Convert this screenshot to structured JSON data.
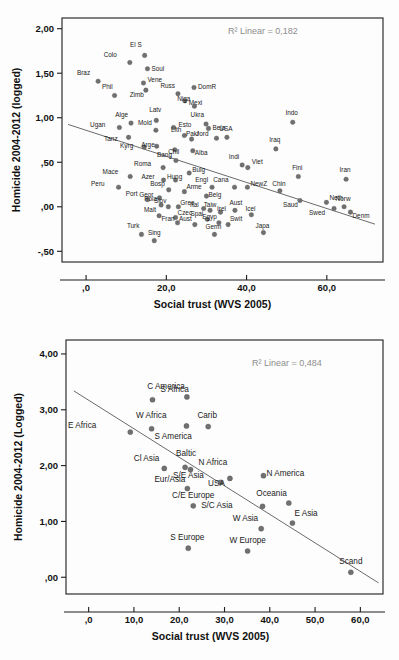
{
  "chart_data": [
    {
      "id": "top",
      "type": "scatter",
      "title": "",
      "xlabel": "Social trust (WVS 2005)",
      "ylabel": "Homicide 2004-2012 (logged)",
      "annotation": "R² Linear = 0,182",
      "xlim": [
        -6.0,
        74.0
      ],
      "ylim": [
        -0.62,
        2.12
      ],
      "xticks": [
        0,
        20,
        40,
        60
      ],
      "xticklabels": [
        ",0",
        "20,0",
        "40,0",
        "60,0"
      ],
      "yticks": [
        -0.5,
        0.0,
        0.5,
        1.0,
        1.5,
        2.0
      ],
      "yticklabels": [
        "-,50",
        ",00",
        ",50",
        "1,00",
        "1,50",
        "2,00"
      ],
      "grid": false,
      "legend": "none",
      "fit": {
        "x0": -4.5,
        "y0": 0.925,
        "x1": 72.0,
        "y1": -0.195
      },
      "points": [
        {
          "label": "Braz",
          "x": 3.0,
          "y": 1.41,
          "lx": -8,
          "ly": -6
        },
        {
          "label": "Colo",
          "x": 10.9,
          "y": 1.62,
          "lx": -13,
          "ly": -6
        },
        {
          "label": "El S",
          "x": 14.6,
          "y": 1.7,
          "lx": -3,
          "ly": -8
        },
        {
          "label": "Soul",
          "x": 15.3,
          "y": 1.55,
          "lx": 4,
          "ly": 2
        },
        {
          "label": "Phil",
          "x": 7.1,
          "y": 1.25,
          "lx": -2,
          "ly": -6
        },
        {
          "label": "Vene",
          "x": 14.3,
          "y": 1.39,
          "lx": 4,
          "ly": -1
        },
        {
          "label": "Zimb",
          "x": 14.9,
          "y": 1.31,
          "lx": -2,
          "ly": 7
        },
        {
          "label": "Russ",
          "x": 22.9,
          "y": 1.27,
          "lx": -3,
          "ly": -6
        },
        {
          "label": "DomR",
          "x": 26.9,
          "y": 1.34,
          "lx": 4,
          "ly": 2
        },
        {
          "label": "Mexi",
          "x": 24.6,
          "y": 1.19,
          "lx": 4,
          "ly": 4
        },
        {
          "label": "Niga",
          "x": 27.0,
          "y": 1.13,
          "lx": -4,
          "ly": -5
        },
        {
          "label": "Alge",
          "x": 11.2,
          "y": 0.94,
          "lx": -3,
          "ly": -6
        },
        {
          "label": "Latv",
          "x": 17.5,
          "y": 0.97,
          "lx": -1,
          "ly": -8
        },
        {
          "label": "Ugan",
          "x": 8.3,
          "y": 0.89,
          "lx": -14,
          "ly": -1
        },
        {
          "label": "Mold",
          "x": 17.4,
          "y": 0.86,
          "lx": -4,
          "ly": -5
        },
        {
          "label": "Esto",
          "x": 21.8,
          "y": 0.89,
          "lx": 5,
          "ly": -1
        },
        {
          "label": "Ukra",
          "x": 29.9,
          "y": 0.93,
          "lx": -2,
          "ly": -7
        },
        {
          "label": "Bela",
          "x": 30.5,
          "y": 0.88,
          "lx": 4,
          "ly": 2
        },
        {
          "label": "USA",
          "x": 35.1,
          "y": 0.78,
          "lx": -1,
          "ly": -6
        },
        {
          "label": "Tanz",
          "x": 10.6,
          "y": 0.78,
          "lx": -11,
          "ly": 4
        },
        {
          "label": "Lith",
          "x": 24.5,
          "y": 0.8,
          "lx": -3,
          "ly": -4
        },
        {
          "label": "Pakr",
          "x": 26.3,
          "y": 0.76,
          "lx": 1,
          "ly": -3
        },
        {
          "label": "Jord",
          "x": 32.5,
          "y": 0.77,
          "lx": -8,
          "ly": -2
        },
        {
          "label": "Indo",
          "x": 51.5,
          "y": 0.95,
          "lx": -1,
          "ly": -7
        },
        {
          "label": "Iraq",
          "x": 47.3,
          "y": 0.65,
          "lx": -1,
          "ly": -7
        },
        {
          "label": "Kyrg",
          "x": 14.5,
          "y": 0.67,
          "lx": -11,
          "ly": 1
        },
        {
          "label": "Arge",
          "x": 17.6,
          "y": 0.68,
          "lx": -2,
          "ly": 1
        },
        {
          "label": "Chil",
          "x": 22.1,
          "y": 0.64,
          "lx": -1,
          "ly": 4
        },
        {
          "label": "Alba",
          "x": 26.6,
          "y": 0.63,
          "lx": 2,
          "ly": 4
        },
        {
          "label": "Indi",
          "x": 38.9,
          "y": 0.47,
          "lx": -3,
          "ly": -6
        },
        {
          "label": "Viet",
          "x": 40.3,
          "y": 0.44,
          "lx": 4,
          "ly": -4
        },
        {
          "label": "Bang",
          "x": 22.4,
          "y": 0.52,
          "lx": -4,
          "ly": -3
        },
        {
          "label": "Roma",
          "x": 19.2,
          "y": 0.44,
          "lx": -12,
          "ly": -2
        },
        {
          "label": "Bulg",
          "x": 25.7,
          "y": 0.38,
          "lx": 3,
          "ly": -1
        },
        {
          "label": "Fini",
          "x": 52.9,
          "y": 0.34,
          "lx": -1,
          "ly": -7
        },
        {
          "label": "Iran",
          "x": 64.8,
          "y": 0.31,
          "lx": -1,
          "ly": -7
        },
        {
          "label": "Mace",
          "x": 11.0,
          "y": 0.34,
          "lx": -12,
          "ly": -3
        },
        {
          "label": "Azer",
          "x": 19.3,
          "y": 0.3,
          "lx": -9,
          "ly": -1
        },
        {
          "label": "Hung",
          "x": 22.3,
          "y": 0.3,
          "lx": -1,
          "ly": -1
        },
        {
          "label": "Cana",
          "x": 37.0,
          "y": 0.22,
          "lx": -6,
          "ly": -5
        },
        {
          "label": "NewZ",
          "x": 40.2,
          "y": 0.22,
          "lx": 3,
          "ly": -1
        },
        {
          "label": "Peru",
          "x": 8.1,
          "y": 0.22,
          "lx": -14,
          "ly": -1
        },
        {
          "label": "Engl",
          "x": 31.4,
          "y": 0.22,
          "lx": -4,
          "ly": -5
        },
        {
          "label": "Chin",
          "x": 48.3,
          "y": 0.18,
          "lx": -1,
          "ly": -5
        },
        {
          "label": "Bosp",
          "x": 20.6,
          "y": 0.19,
          "lx": -4,
          "ly": -4
        },
        {
          "label": "Arme",
          "x": 24.5,
          "y": 0.17,
          "lx": 2,
          "ly": -3
        },
        {
          "label": "Belg",
          "x": 30.0,
          "y": 0.12,
          "lx": 2,
          "ly": 1
        },
        {
          "label": "Port",
          "x": 15.3,
          "y": 0.08,
          "lx": -10,
          "ly": -4
        },
        {
          "label": "Geor",
          "x": 18.3,
          "y": 0.1,
          "lx": -6,
          "ly": -1
        },
        {
          "label": "Saud",
          "x": 53.3,
          "y": 0.07,
          "lx": -2,
          "ly": 6
        },
        {
          "label": "Neth",
          "x": 59.9,
          "y": 0.05,
          "lx": 3,
          "ly": -2
        },
        {
          "label": "Norw",
          "x": 64.3,
          "y": 0.0,
          "lx": -1,
          "ly": -6
        },
        {
          "label": "Pola",
          "x": 18.7,
          "y": 0.02,
          "lx": -4,
          "ly": -4
        },
        {
          "label": "Slov",
          "x": 20.5,
          "y": 0.0,
          "lx": -2,
          "ly": -4
        },
        {
          "label": "Gree",
          "x": 23.0,
          "y": 0.0,
          "lx": 2,
          "ly": -2
        },
        {
          "label": "Ital",
          "x": 29.3,
          "y": -0.02,
          "lx": -5,
          "ly": -2
        },
        {
          "label": "Taiw",
          "x": 30.9,
          "y": -0.04,
          "lx": 0,
          "ly": -3
        },
        {
          "label": "Irel",
          "x": 33.5,
          "y": -0.06,
          "lx": 1,
          "ly": -1
        },
        {
          "label": "Aust",
          "x": 37.1,
          "y": -0.04,
          "lx": 1,
          "ly": -5
        },
        {
          "label": "Icel",
          "x": 41.2,
          "y": -0.09,
          "lx": -1,
          "ly": -4
        },
        {
          "label": "Swed",
          "x": 61.8,
          "y": -0.02,
          "lx": -9,
          "ly": 6
        },
        {
          "label": "Denm",
          "x": 65.9,
          "y": -0.06,
          "lx": 2,
          "ly": 6
        },
        {
          "label": "Malt",
          "x": 18.2,
          "y": -0.1,
          "lx": -3,
          "ly": -4
        },
        {
          "label": "Czec",
          "x": 22.3,
          "y": -0.12,
          "lx": 2,
          "ly": -2
        },
        {
          "label": "Spai",
          "x": 30.2,
          "y": -0.14,
          "lx": -4,
          "ly": -3
        },
        {
          "label": "Turk",
          "x": 13.8,
          "y": -0.31,
          "lx": -2,
          "ly": -6
        },
        {
          "label": "Sing",
          "x": 17.0,
          "y": -0.38,
          "lx": 0,
          "ly": -6
        },
        {
          "label": "Fran",
          "x": 22.8,
          "y": -0.18,
          "lx": -3,
          "ly": -2
        },
        {
          "label": "Aust",
          "x": 27.1,
          "y": -0.2,
          "lx": -3,
          "ly": -4
        },
        {
          "label": "Egyp",
          "x": 33.1,
          "y": -0.18,
          "lx": -2,
          "ly": -4
        },
        {
          "label": "Swit",
          "x": 35.4,
          "y": -0.2,
          "lx": 2,
          "ly": -4
        },
        {
          "label": "Germ",
          "x": 32.0,
          "y": -0.31,
          "lx": -1,
          "ly": -5
        },
        {
          "label": "Japa",
          "x": 44.2,
          "y": -0.29,
          "lx": -1,
          "ly": -5
        }
      ]
    },
    {
      "id": "bottom",
      "type": "scatter",
      "title": "",
      "xlabel": "Social trust (WVS 2005)",
      "ylabel": "Homicide 2004-2012 (Logged)",
      "annotation": "R² Linear = 0,484",
      "xlim": [
        -5.0,
        65.0
      ],
      "ylim": [
        -0.3,
        4.25
      ],
      "xticks": [
        0,
        10,
        20,
        30,
        40,
        50,
        60
      ],
      "xticklabels": [
        ",0",
        "10,0",
        "20,0",
        "30,0",
        "40,0",
        "50,0",
        "60,0"
      ],
      "yticks": [
        0.0,
        1.0,
        2.0,
        3.0,
        4.0
      ],
      "yticklabels": [
        ",00",
        "1,00",
        "2,00",
        "3,00",
        "4,00"
      ],
      "grid": false,
      "legend": "none",
      "fit": {
        "x0": -3.3,
        "y0": 3.34,
        "x1": 64.0,
        "y1": -0.1
      },
      "points": [
        {
          "label": "C America",
          "x": 21.7,
          "y": 3.23,
          "lx": -2,
          "ly": -8
        },
        {
          "label": "S Africa",
          "x": 14.1,
          "y": 3.18,
          "lx": 8,
          "ly": -8
        },
        {
          "label": "W Africa",
          "x": 21.6,
          "y": 2.71,
          "lx": -20,
          "ly": -8
        },
        {
          "label": "Carib",
          "x": 26.4,
          "y": 2.7,
          "lx": -1,
          "ly": -9
        },
        {
          "label": "E Africa",
          "x": 9.2,
          "y": 2.6,
          "lx": -34,
          "ly": -4
        },
        {
          "label": "S America",
          "x": 13.9,
          "y": 2.66,
          "lx": 3,
          "ly": 10
        },
        {
          "label": "Baltic",
          "x": 21.3,
          "y": 1.97,
          "lx": 1,
          "ly": -11
        },
        {
          "label": "Cl Asia",
          "x": 16.7,
          "y": 1.95,
          "lx": -5,
          "ly": -7
        },
        {
          "label": "N Africa",
          "x": 22.5,
          "y": 1.93,
          "lx": 8,
          "ly": -5
        },
        {
          "label": "S/E Asia",
          "x": 29.2,
          "y": 1.7,
          "lx": -17,
          "ly": -4
        },
        {
          "label": "N America",
          "x": 38.6,
          "y": 1.82,
          "lx": 3,
          "ly": 0
        },
        {
          "label": "USA",
          "x": 31.2,
          "y": 1.77,
          "lx": -5,
          "ly": 8
        },
        {
          "label": "Eur/Asia",
          "x": 21.8,
          "y": 1.59,
          "lx": -2,
          "ly": -6
        },
        {
          "label": "Oceania",
          "x": 44.2,
          "y": 1.33,
          "lx": -2,
          "ly": -7
        },
        {
          "label": "C/E Europe",
          "x": 23.1,
          "y": 1.28,
          "lx": 0,
          "ly": -8
        },
        {
          "label": "S/C Asia",
          "x": 38.4,
          "y": 1.27,
          "lx": -30,
          "ly": 2
        },
        {
          "label": "E Asia",
          "x": 45.0,
          "y": 0.97,
          "lx": 2,
          "ly": -7
        },
        {
          "label": "W Asia",
          "x": 38.1,
          "y": 0.87,
          "lx": -3,
          "ly": -8
        },
        {
          "label": "S Europe",
          "x": 22.0,
          "y": 0.52,
          "lx": -1,
          "ly": -8
        },
        {
          "label": "W Europe",
          "x": 35.1,
          "y": 0.47,
          "lx": 0,
          "ly": -8
        },
        {
          "label": "Scand",
          "x": 57.9,
          "y": 0.09,
          "lx": 0,
          "ly": -8
        }
      ]
    }
  ]
}
